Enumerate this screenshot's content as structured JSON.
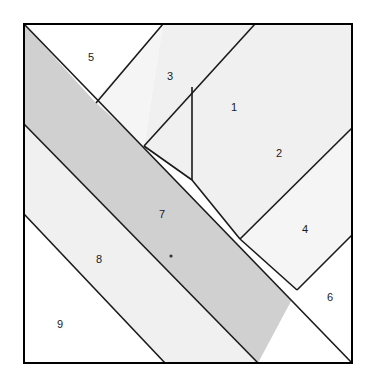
{
  "figure": {
    "kind": "tangram-dissection-diagram",
    "title": "",
    "square": {
      "left": 24,
      "top": 24,
      "right": 352,
      "bottom": 363,
      "border_color": "#000000",
      "border_width": 2
    },
    "palette": {
      "white": "#ffffff",
      "light_gray": "#f0f0f0",
      "pale_gray": "#ebebeb",
      "band_gray": "#d0d0d0",
      "stroke": "#1a1a1a",
      "label_color": "#1a1a1a",
      "background": "#ffffff"
    },
    "marker_dot": {
      "name": "center-dot",
      "x": 171,
      "y": 256,
      "r": 1.6,
      "color": "#333333"
    },
    "regions": [
      {
        "id": 1,
        "label": "1",
        "fill": "#f0f0f0",
        "label_x": 234,
        "label_y": 108,
        "points": "163,24 255,24 192,87 192,180 144,146"
      },
      {
        "id": 2,
        "label": "2",
        "fill": "#f0f0f0",
        "label_x": 279,
        "label_y": 154,
        "points": "255,24 352,24 352,128 240,239 192,180 192,87"
      },
      {
        "id": 3,
        "label": "3",
        "fill": "#f5f5f5",
        "label_x": 170,
        "label_y": 77,
        "points": "163,24 144,146 96,103 98,97"
      },
      {
        "id": 4,
        "label": "4",
        "fill": "#f5f5f5",
        "label_x": 305,
        "label_y": 230,
        "points": "352,128 352,235 297,290 240,239"
      },
      {
        "id": 5,
        "label": "5",
        "fill": "#ffffff",
        "label_x": 91,
        "label_y": 58,
        "points": "24,24 163,24 98,97 96,103"
      },
      {
        "id": 6,
        "label": "6",
        "fill": "#ffffff",
        "label_x": 330,
        "label_y": 298,
        "points": "352,235 352,363 258,363 297,290"
      },
      {
        "id": 7,
        "label": "7",
        "fill": "#d0d0d0",
        "label_x": 162,
        "label_y": 215,
        "points": "24,24 24,124 258,363 352,363"
      },
      {
        "id": 8,
        "label": "8",
        "fill": "#f0f0f0",
        "label_x": 99,
        "label_y": 260,
        "points": "24,124 24,214 165,363 258,363"
      },
      {
        "id": 9,
        "label": "9",
        "fill": "#ffffff",
        "label_x": 60,
        "label_y": 325,
        "points": "24,214 24,363 165,363"
      }
    ],
    "cut_lines": [
      {
        "name": "cut-line-a",
        "x1": 24,
        "y1": 24,
        "x2": 352,
        "y2": 363
      },
      {
        "name": "cut-line-b",
        "x1": 24,
        "y1": 124,
        "x2": 258,
        "y2": 363
      },
      {
        "name": "cut-line-c",
        "x1": 24,
        "y1": 214,
        "x2": 165,
        "y2": 363
      },
      {
        "name": "cut-line-d",
        "x1": 163,
        "y1": 24,
        "x2": 96,
        "y2": 103
      },
      {
        "name": "cut-line-e",
        "x1": 255,
        "y1": 24,
        "x2": 144,
        "y2": 146
      },
      {
        "name": "cut-line-f",
        "x1": 352,
        "y1": 128,
        "x2": 240,
        "y2": 239
      },
      {
        "name": "cut-line-g",
        "x1": 352,
        "y1": 235,
        "x2": 297,
        "y2": 290
      },
      {
        "name": "cut-line-h",
        "x1": 192,
        "y1": 87,
        "x2": 192,
        "y2": 180
      },
      {
        "name": "cut-line-i",
        "x1": 144,
        "y1": 146,
        "x2": 192,
        "y2": 180
      },
      {
        "name": "cut-line-j",
        "x1": 192,
        "y1": 180,
        "x2": 240,
        "y2": 239
      },
      {
        "name": "cut-line-k",
        "x1": 240,
        "y1": 239,
        "x2": 297,
        "y2": 290
      }
    ]
  }
}
